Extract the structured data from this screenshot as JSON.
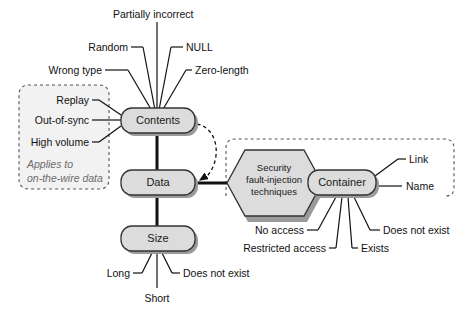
{
  "diagram": {
    "colors": {
      "node_fill": "#dcdcdc",
      "node_stroke": "#333333",
      "node_shadow": "#9a9a9a",
      "line": "#111111",
      "dashed_box": "#555555",
      "note_text": "#6b6b6b",
      "background": "#ffffff"
    },
    "nodes": [
      {
        "id": "contents",
        "label": "Contents",
        "shape": "rounded-rect"
      },
      {
        "id": "data",
        "label": "Data",
        "shape": "rounded-rect"
      },
      {
        "id": "size",
        "label": "Size",
        "shape": "rounded-rect"
      },
      {
        "id": "container",
        "label": "Container",
        "shape": "rounded-rect"
      },
      {
        "id": "techniques",
        "label": "Security fault-injection techniques",
        "shape": "hexagon",
        "lines": [
          "Security",
          "fault-injection",
          "techniques"
        ]
      }
    ],
    "contents_leaves": [
      {
        "id": "partially-incorrect",
        "label": "Partially incorrect"
      },
      {
        "id": "random",
        "label": "Random"
      },
      {
        "id": "null",
        "label": "NULL"
      },
      {
        "id": "wrong-type",
        "label": "Wrong type"
      },
      {
        "id": "zero-length",
        "label": "Zero-length"
      },
      {
        "id": "replay",
        "label": "Replay"
      },
      {
        "id": "out-of-sync",
        "label": "Out-of-sync"
      },
      {
        "id": "high-volume",
        "label": "High volume"
      }
    ],
    "size_leaves": [
      {
        "id": "long",
        "label": "Long"
      },
      {
        "id": "short",
        "label": "Short"
      },
      {
        "id": "size-does-not-exist",
        "label": "Does not exist"
      }
    ],
    "container_leaves": [
      {
        "id": "link",
        "label": "Link"
      },
      {
        "id": "name",
        "label": "Name"
      },
      {
        "id": "no-access",
        "label": "No access"
      },
      {
        "id": "restricted-access",
        "label": "Restricted access"
      },
      {
        "id": "exists",
        "label": "Exists"
      },
      {
        "id": "container-does-not-exist",
        "label": "Does not exist"
      }
    ],
    "notes": [
      {
        "id": "on-the-wire-note",
        "line1": "Applies to",
        "line2": "on-the-wire data"
      }
    ]
  }
}
